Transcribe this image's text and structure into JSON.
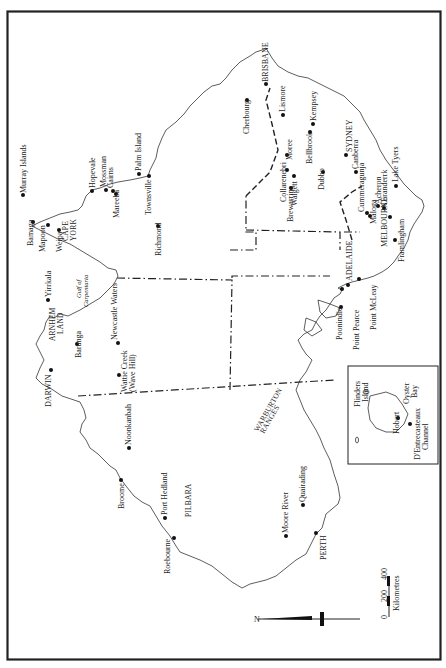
{
  "map": {
    "orientation": "rotated 90 degrees; north points left",
    "north_label": "N",
    "scale": {
      "ticks": [
        "0",
        "200",
        "400"
      ],
      "unit": "Kilometres"
    },
    "regions": [
      {
        "id": "cape-york",
        "label": "CAPE\nYORK"
      },
      {
        "id": "arnhem-land",
        "label": "ARNHEM\nLAND"
      },
      {
        "id": "pilbara",
        "label": "PILBARA"
      },
      {
        "id": "warburton",
        "label": "WARBURTON\nRANGES"
      },
      {
        "id": "gulf",
        "label": "Gulf of\nCarpentaria"
      }
    ],
    "places": {
      "murray_islands": "Murray Islands",
      "bamaga": "Bamaga",
      "mapoon": "Mapoon",
      "weipa": "Weipa",
      "hopevale": "Hopevale",
      "mossman": "Mossman",
      "cairns": "Cairns",
      "mareeba": "Mareeba",
      "palm_island": "Palm Island",
      "townsville": "Townsville",
      "richmond": "Richmond",
      "yirrkala": "Yirrkala",
      "bamiyili": "Barunga",
      "newcastle_waters": "Newcastle Waters",
      "wattie_creek": "Wattie Creek",
      "wave_hill": "(Wave Hill)",
      "darwin": "DARWIN",
      "noonkanbah": "Noonkanbah",
      "broome": "Broome",
      "port_hedland": "Port Hedland",
      "roebourne": "Roebourne",
      "moore_river": "Moore River",
      "quairading": "Quairading",
      "perth": "PERTH",
      "brisbane": "BRISBANE",
      "lismore": "Lismore",
      "cherbourg": "Cherbourg",
      "moree": "Moree",
      "kempsey": "Kempsey",
      "bellbrook": "Bellbrook",
      "collarenebri": "Collarenebri",
      "walgett": "Walgett",
      "brewarrina": "Brewarrina",
      "dubbo": "Dubbo",
      "sydney": "SYDNEY",
      "canberra": "Canberra",
      "cummeragunja": "Cummeragunja",
      "maloga": "Maloga",
      "acheron": "Acheron",
      "coranderrk": "Coranderrk",
      "lake_tyers": "Lake Tyers",
      "melbourne": "MELBOURNE",
      "framlingham": "Framlingham",
      "adelaide": "ADELAIDE",
      "point_mcleay": "Point McLeay",
      "point_pearce": "Point Pearce",
      "poonindie": "Poonindie"
    },
    "inset": {
      "flinders_island": "Flinders\nIsland",
      "hobart": "Hobart",
      "oyster_bay": "Oyster\nBay",
      "dentrecasteaux": "D'Entrecasteaux\nChannel"
    }
  }
}
